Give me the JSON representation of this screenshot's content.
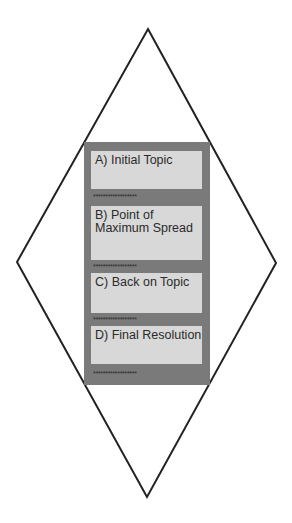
{
  "diagram": {
    "shape": "diamond",
    "colors": {
      "outline": "#222222",
      "panel": "#7a7a7a",
      "box": "#d8d8d8",
      "text": "#2a2a2a"
    },
    "stages": [
      {
        "label": "A) Initial Topic",
        "separator": "******************"
      },
      {
        "label": "B) Point of Maximum Spread",
        "separator": "******************"
      },
      {
        "label": "C) Back on Topic",
        "separator": "******************"
      },
      {
        "label": "D) Final Resolution",
        "separator": "******************"
      }
    ]
  }
}
